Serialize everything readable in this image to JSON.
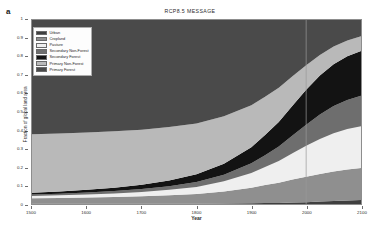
{
  "panel_label": "a",
  "chart_data": {
    "type": "area",
    "title": "RCP8.5  MESSAGE",
    "xlabel": "Year",
    "ylabel": "Fraction of global land area",
    "xlim": [
      1500,
      2100
    ],
    "ylim": [
      0,
      1
    ],
    "grid": false,
    "legend_position": "top-left",
    "xticks": [
      1500,
      1600,
      1700,
      1800,
      1900,
      2000,
      2100
    ],
    "yticks": [
      0,
      0.1,
      0.2,
      0.3,
      0.4,
      0.5,
      0.6,
      0.7,
      0.8,
      0.9,
      1
    ],
    "stack_order_bottom_to_top": [
      "Urban",
      "Cropland",
      "Pasture",
      "Secondary Non-Forest",
      "Secondary Forest",
      "Primary Non-Forest",
      "Primary Forest"
    ],
    "x": [
      1500,
      1550,
      1600,
      1650,
      1700,
      1750,
      1800,
      1850,
      1900,
      1925,
      1950,
      1975,
      2000,
      2025,
      2050,
      2075,
      2100
    ],
    "series": [
      {
        "name": "Urban",
        "color": "#3f3f3f",
        "values": [
          0.001,
          0.001,
          0.001,
          0.001,
          0.001,
          0.002,
          0.002,
          0.003,
          0.004,
          0.005,
          0.006,
          0.008,
          0.01,
          0.013,
          0.016,
          0.019,
          0.022
        ]
      },
      {
        "name": "Cropland",
        "color": "#8f8f8f",
        "values": [
          0.03,
          0.032,
          0.034,
          0.037,
          0.041,
          0.046,
          0.053,
          0.065,
          0.085,
          0.098,
          0.11,
          0.125,
          0.138,
          0.15,
          0.16,
          0.168,
          0.173
        ]
      },
      {
        "name": "Pasture",
        "color": "#efefef",
        "values": [
          0.012,
          0.014,
          0.016,
          0.019,
          0.023,
          0.029,
          0.038,
          0.055,
          0.08,
          0.098,
          0.118,
          0.143,
          0.168,
          0.19,
          0.208,
          0.22,
          0.228
        ]
      },
      {
        "name": "Secondary Non-Forest",
        "color": "#6e6e6e",
        "values": [
          0.008,
          0.009,
          0.011,
          0.013,
          0.016,
          0.02,
          0.026,
          0.036,
          0.052,
          0.064,
          0.078,
          0.096,
          0.115,
          0.133,
          0.148,
          0.158,
          0.165
        ]
      },
      {
        "name": "Secondary Forest",
        "color": "#131313",
        "values": [
          0.01,
          0.012,
          0.015,
          0.019,
          0.024,
          0.031,
          0.042,
          0.06,
          0.088,
          0.11,
          0.134,
          0.162,
          0.19,
          0.212,
          0.228,
          0.238,
          0.244
        ]
      },
      {
        "name": "Primary Non-Forest",
        "color": "#b9b9b9",
        "values": [
          0.318,
          0.315,
          0.311,
          0.306,
          0.299,
          0.29,
          0.277,
          0.258,
          0.228,
          0.208,
          0.186,
          0.16,
          0.133,
          0.112,
          0.096,
          0.086,
          0.08
        ]
      },
      {
        "name": "Primary Forest",
        "color": "#4a4a4a",
        "values": [
          0.621,
          0.617,
          0.612,
          0.605,
          0.596,
          0.582,
          0.562,
          0.523,
          0.463,
          0.417,
          0.368,
          0.306,
          0.246,
          0.19,
          0.144,
          0.111,
          0.088
        ]
      }
    ],
    "annotations": [
      {
        "type": "vline",
        "x": 2000,
        "color": "#9a9a9a"
      }
    ]
  },
  "legend": {
    "items": [
      {
        "label": "Urban",
        "color": "#3f3f3f"
      },
      {
        "label": "Cropland",
        "color": "#8f8f8f"
      },
      {
        "label": "Pasture",
        "color": "#efefef"
      },
      {
        "label": "Secondary Non-Forest",
        "color": "#6e6e6e"
      },
      {
        "label": "Secondary Forest",
        "color": "#131313"
      },
      {
        "label": "Primary Non-Forest",
        "color": "#b9b9b9"
      },
      {
        "label": "Primary Forest",
        "color": "#4a4a4a"
      }
    ]
  }
}
